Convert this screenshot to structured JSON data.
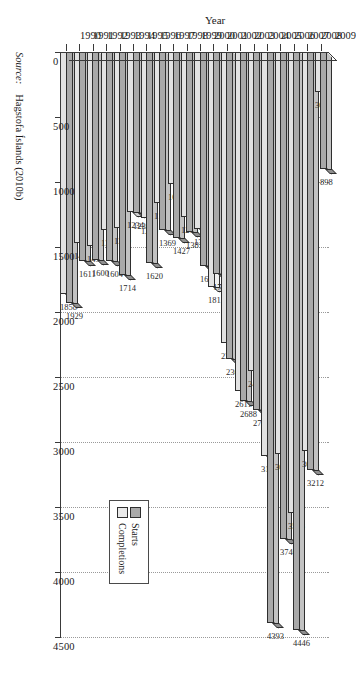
{
  "chart_data": {
    "type": "bar",
    "orientation": "horizontal",
    "title": "",
    "xlabel": "",
    "ylabel": "Year",
    "categories": [
      "1990",
      "1991",
      "1992",
      "1993",
      "1994",
      "1995",
      "1996",
      "1997",
      "1998",
      "1999",
      "2000",
      "2001",
      "2002",
      "2003",
      "2004",
      "2005",
      "2006",
      "2007",
      "2008",
      "2009"
    ],
    "xlim": [
      0,
      4500
    ],
    "xticks": [
      0,
      500,
      1000,
      1500,
      2000,
      2500,
      3000,
      3500,
      4000,
      4500
    ],
    "xtick_labels": [
      "0",
      "500",
      "1000",
      "1500",
      "2000",
      "2500",
      "3000",
      "3500",
      "4000",
      "4500"
    ],
    "grid": true,
    "grid_axis": "x",
    "legend_position": "bottom-left",
    "series": [
      {
        "name": "Starts",
        "color": "#a9a9a9",
        "values": [
          1929,
          1611,
          1600,
          1604,
          1714,
          1236,
          1620,
          1369,
          1427,
          1381,
          1643,
          1711,
          2360,
          2688,
          2751,
          4393,
          3746,
          4446,
          3212,
          898
        ]
      },
      {
        "name": "Completions",
        "color": "#e2e2e2",
        "values": [
          1858,
          1470,
          1495,
          1372,
          1350,
          1234,
          1279,
          1163,
          1016,
          1266,
          1358,
          1811,
          2240,
          2611,
          2455,
          3106,
          3094,
          3548,
          3068,
          308
        ]
      }
    ],
    "data_labels": {
      "1990": {
        "Starts": "1929",
        "Completions": "1858"
      },
      "1991": {
        "Starts": "1611",
        "Completions": "1470"
      },
      "1992": {
        "Starts": "1600",
        "Completions": "1495"
      },
      "1993": {
        "Starts": "1604",
        "Completions": "1372"
      },
      "1994": {
        "Starts": "1714",
        "Completions": "1350"
      },
      "1995": {
        "Starts": "1236",
        "Completions": "1234"
      },
      "1996": {
        "Starts": "1620",
        "Completions": "1279"
      },
      "1997": {
        "Starts": "1369",
        "Completions": "1163"
      },
      "1998": {
        "Starts": "1427",
        "Completions": "1016"
      },
      "1999": {
        "Starts": "1381",
        "Completions": "1266"
      },
      "2000": {
        "Starts": "1643",
        "Completions": "1358"
      },
      "2001": {
        "Starts": "1711",
        "Completions": "1811"
      },
      "2002": {
        "Starts": "2360",
        "Completions": "2240"
      },
      "2003": {
        "Starts": "2688",
        "Completions": "2611"
      },
      "2004": {
        "Starts": "2751",
        "Completions": "2455"
      },
      "2005": {
        "Starts": "4393",
        "Completions": "3106"
      },
      "2006": {
        "Starts": "3746",
        "Completions": "3094"
      },
      "2007": {
        "Starts": "4446",
        "Completions": "3548"
      },
      "2008": {
        "Starts": "3212",
        "Completions": "3068"
      },
      "2009": {
        "Starts": "898",
        "Completions": "308"
      }
    }
  },
  "legend": {
    "items": [
      {
        "label": "Starts",
        "swatch": "starts-swatch"
      },
      {
        "label": "Completions",
        "swatch": "completions-swatch"
      }
    ]
  },
  "axes": {
    "year_axis_title": "Year"
  },
  "source": {
    "prefix": "Source:",
    "text": "Hagstofa Íslands (2010b)"
  }
}
